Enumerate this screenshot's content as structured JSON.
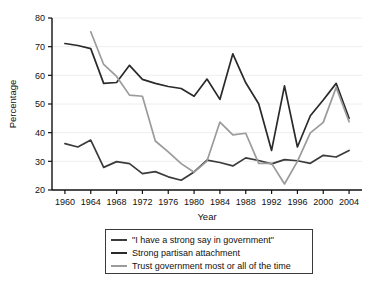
{
  "chart_data": {
    "type": "line",
    "title": "",
    "xlabel": "Year",
    "ylabel": "Percentage",
    "xlim": [
      1958,
      2006
    ],
    "ylim": [
      20,
      80
    ],
    "yticks": [
      20,
      30,
      40,
      50,
      60,
      70,
      80
    ],
    "xticks": [
      1960,
      1964,
      1968,
      1972,
      1976,
      1980,
      1984,
      1988,
      1992,
      1996,
      2000,
      2004
    ],
    "grid": "horizontal",
    "legend_position": "below-axes",
    "series": [
      {
        "name": "\"I have a strong say in government\"",
        "color": "#3b3b3b",
        "x": [
          1960,
          1962,
          1964,
          1966,
          1968,
          1970,
          1972,
          1974,
          1976,
          1978,
          1980,
          1982,
          1984,
          1986,
          1988,
          1990,
          1992,
          1994,
          1996,
          1998,
          2000,
          2002,
          2004
        ],
        "values": [
          36.2,
          35.0,
          37.4,
          27.9,
          29.9,
          29.2,
          25.7,
          26.4,
          24.6,
          23.4,
          26.3,
          30.4,
          29.6,
          28.4,
          31.2,
          30.3,
          29.1,
          30.6,
          30.2,
          29.3,
          32.1,
          31.5,
          33.8
        ]
      },
      {
        "name": "Strong partisan attachment",
        "color": "#2a2a2a",
        "x": [
          1960,
          1962,
          1964,
          1966,
          1968,
          1970,
          1972,
          1974,
          1976,
          1978,
          1980,
          1982,
          1984,
          1986,
          1988,
          1990,
          1992,
          1994,
          1996,
          1998,
          2000,
          2002,
          2004
        ],
        "values": [
          71.1,
          70.4,
          69.3,
          57.2,
          57.5,
          63.5,
          58.6,
          57.2,
          56.1,
          55.4,
          52.7,
          58.7,
          51.6,
          67.5,
          57.4,
          50.1,
          33.8,
          56.3,
          35.0,
          45.9,
          51.4,
          57.2,
          45.0
        ]
      },
      {
        "name": "Trust government most or all of the time",
        "color": "#9b9b9b",
        "x": [
          1964,
          1966,
          1968,
          1970,
          1972,
          1974,
          1976,
          1978,
          1980,
          1982,
          1984,
          1986,
          1988,
          1990,
          1992,
          1994,
          1996,
          1998,
          2000,
          2002,
          2004
        ],
        "values": [
          75.2,
          63.8,
          59.6,
          53.1,
          52.7,
          37.1,
          33.3,
          29.2,
          26.2,
          30.1,
          43.7,
          39.2,
          39.8,
          29.3,
          29.3,
          22.1,
          30.0,
          39.9,
          43.6,
          55.8,
          43.8
        ]
      }
    ]
  },
  "legend": {
    "items": [
      {
        "label": "\"I have a strong say in government\"",
        "color": "#3b3b3b"
      },
      {
        "label": "Strong partisan attachment",
        "color": "#2a2a2a"
      },
      {
        "label": "Trust government most or all of the time",
        "color": "#9b9b9b"
      }
    ]
  },
  "axes": {
    "xlabel": "Year",
    "ylabel": "Percentage"
  }
}
